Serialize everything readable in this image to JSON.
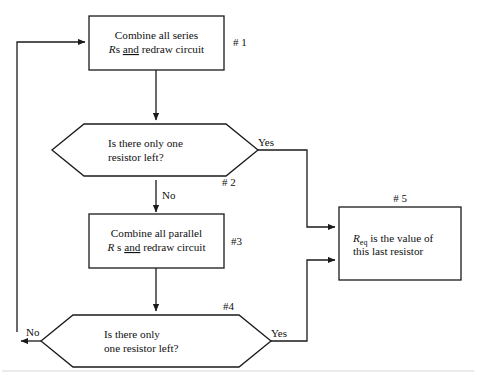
{
  "diagram": {
    "canvas": {
      "width": 477,
      "height": 377,
      "background": "#ffffff"
    },
    "ink_color": "#1a1a1a",
    "nodes": [
      {
        "id": "n1",
        "kind": "process",
        "tag": "# 1",
        "line1": "Combine all series",
        "line2_prefix": "R",
        "line2_mid": "s ",
        "line2_underlined": "and",
        "line2_suffix": " redraw circuit"
      },
      {
        "id": "n2",
        "kind": "decision",
        "tag": "# 2",
        "line1": "Is there only one",
        "line2": "resistor left?",
        "yes_label": "Yes",
        "no_label": "No"
      },
      {
        "id": "n3",
        "kind": "process",
        "tag": "#3",
        "line1": "Combine all parallel",
        "line2_prefix": "R",
        "line2_mid": " s ",
        "line2_underlined": "and",
        "line2_suffix": " redraw circuit"
      },
      {
        "id": "n4",
        "kind": "decision",
        "tag": "#4",
        "line1": "Is there only",
        "line2": "one resistor left?",
        "yes_label": "Yes",
        "no_label": "No"
      },
      {
        "id": "n5",
        "kind": "process",
        "tag": "# 5",
        "line1_prefix": "R",
        "line1_subscript": "eq",
        "line1_suffix": " is the value of",
        "line2": "this last resistor"
      }
    ]
  }
}
